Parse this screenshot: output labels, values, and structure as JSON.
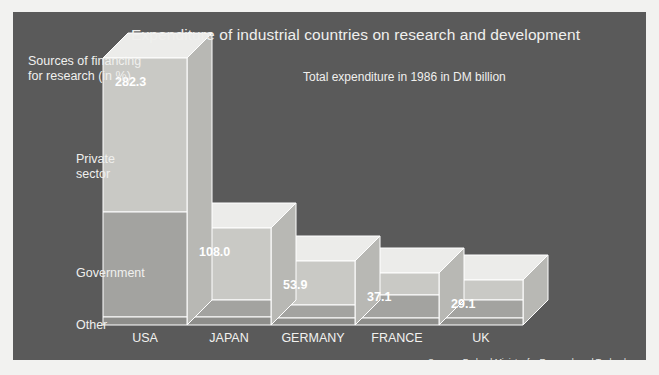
{
  "panel": {
    "background_color": "#5a5a5a",
    "border_color": "#f2f2f0"
  },
  "header": {
    "title": "Expenditure of industrial countries on research and development",
    "subtitle": "Total expenditure in 1986 in DM billion"
  },
  "axis": {
    "caption_line1": "Sources of financing",
    "caption_line2": "for research (in %)",
    "categories": [
      {
        "label": "Private\nsector"
      },
      {
        "label": "Government"
      },
      {
        "label": "Other"
      }
    ],
    "label_private": "Private\nsector",
    "label_government": "Government",
    "label_other": "Other"
  },
  "footer": {
    "source": "Source:  Federal Ministry for Research and Technology"
  },
  "colors": {
    "segment_private": "#c9c9c5",
    "segment_government": "#a3a3a0",
    "segment_other": "#8e8e8b",
    "top_face": "#ececea",
    "side_face": "#b8b8b4",
    "outline": "#ffffff"
  },
  "chart_data": {
    "type": "bar",
    "title": "Expenditure of industrial countries on research and development",
    "subtitle": "Total expenditure in 1986 in DM billion",
    "xlabel": "",
    "ylabel": "Sources of financing for research (in %)",
    "unit": "DM billion",
    "year": 1986,
    "grid": false,
    "legend": false,
    "stacked": true,
    "stack_unit": "percent",
    "categories": [
      "USA",
      "JAPAN",
      "GERMANY",
      "FRANCE",
      "UK"
    ],
    "values": [
      282.3,
      108.0,
      53.9,
      37.1,
      29.1
    ],
    "value_labels": [
      "282.3",
      "108.0",
      "53.9",
      "37.1",
      "29.1"
    ],
    "stack_segments": [
      "Private sector",
      "Government",
      "Other"
    ],
    "series": [
      {
        "name": "Private sector",
        "values": [
          50,
          52,
          38,
          28,
          24
        ]
      },
      {
        "name": "Government",
        "values": [
          47,
          40,
          56,
          66,
          68
        ]
      },
      {
        "name": "Other",
        "values": [
          3,
          8,
          6,
          6,
          8
        ]
      }
    ],
    "bars": [
      {
        "country": "USA",
        "total": 282.3,
        "label": "282.3",
        "x": 90,
        "width": 84,
        "top": 46,
        "split_private_government": 200,
        "split_government_other": 305,
        "baseline": 313
      },
      {
        "country": "JAPAN",
        "total": 108.0,
        "label": "108.0",
        "x": 174,
        "width": 84,
        "top": 216,
        "split_private_government": 288,
        "split_government_other": 305,
        "baseline": 313
      },
      {
        "country": "GERMANY",
        "total": 53.9,
        "label": "53.9",
        "x": 258,
        "width": 84,
        "top": 249,
        "split_private_government": 293,
        "split_government_other": 306,
        "baseline": 313
      },
      {
        "country": "FRANCE",
        "total": 37.1,
        "label": "37.1",
        "x": 342,
        "width": 84,
        "top": 261,
        "split_private_government": 283,
        "split_government_other": 306,
        "baseline": 313
      },
      {
        "country": "UK",
        "total": 29.1,
        "label": "29.1",
        "x": 426,
        "width": 84,
        "top": 268,
        "split_private_government": 288,
        "split_government_other": 306,
        "baseline": 313
      }
    ],
    "depth_x": 25,
    "depth_y": 25
  }
}
